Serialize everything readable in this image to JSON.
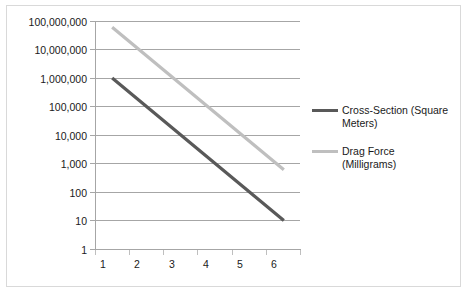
{
  "chart_data": {
    "type": "line",
    "title": "",
    "subtitle": "",
    "xlabel": "",
    "ylabel": "",
    "yscale": "log",
    "ylim": [
      1,
      100000000
    ],
    "xlim": [
      1,
      6
    ],
    "grid": true,
    "legend_position": "right",
    "x": [
      1,
      2,
      3,
      4,
      5,
      6
    ],
    "xticklabels": [
      "1",
      "2",
      "3",
      "4",
      "5",
      "6"
    ],
    "yticklabels": [
      "100,000,000",
      "10,000,000",
      "1,000,000",
      "100,000",
      "10,000",
      "1,000",
      "100",
      "10",
      "1"
    ],
    "ytickvalues": [
      100000000,
      10000000,
      1000000,
      100000,
      10000,
      1000,
      100,
      10,
      1
    ],
    "series": [
      {
        "name": "Cross-Section (Square Meters)",
        "color": "#595959",
        "values": [
          1000000,
          100000,
          10000,
          1000,
          100,
          10
        ]
      },
      {
        "name": "Drag Force (Milligrams)",
        "color": "#bfbfbf",
        "values": [
          60000000,
          6000000,
          600000,
          60000,
          6000,
          600
        ]
      }
    ]
  },
  "legend": {
    "entries": [
      {
        "label": "Cross-Section (Square Meters)",
        "color": "#595959"
      },
      {
        "label": "Drag Force (Milligrams)",
        "color": "#bfbfbf"
      }
    ]
  },
  "colors": {
    "axis": "#a6a6a6",
    "grid": "#a6a6a6",
    "frame": "#d9d9d9",
    "text": "#1a1a1a",
    "background": "#ffffff"
  }
}
